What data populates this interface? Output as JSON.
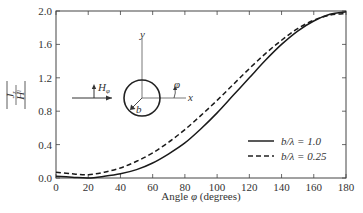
{
  "chart_data": {
    "type": "line",
    "title": "",
    "xlabel": "Angle φ (degrees)",
    "ylabel": "|J_z / H^i|",
    "xlim": [
      0,
      180
    ],
    "ylim": [
      0.0,
      2.0
    ],
    "x_ticks": [
      "0",
      "20",
      "40",
      "60",
      "80",
      "100",
      "120",
      "140",
      "160",
      "180"
    ],
    "y_ticks": [
      "0.0",
      "0.4",
      "0.8",
      "1.2",
      "1.6",
      "2.0"
    ],
    "grid": false,
    "legend_position": "lower right",
    "x": [
      0,
      10,
      20,
      30,
      40,
      50,
      60,
      70,
      80,
      90,
      100,
      110,
      120,
      130,
      140,
      150,
      160,
      170,
      180
    ],
    "series": [
      {
        "name": "b/λ = 1.0",
        "style": "solid",
        "values": [
          0.02,
          0.01,
          0.0,
          0.02,
          0.05,
          0.1,
          0.18,
          0.29,
          0.42,
          0.59,
          0.78,
          0.99,
          1.2,
          1.41,
          1.6,
          1.76,
          1.88,
          1.96,
          1.99
        ]
      },
      {
        "name": "b/λ = 0.25",
        "style": "dashed",
        "values": [
          0.07,
          0.05,
          0.04,
          0.07,
          0.12,
          0.2,
          0.3,
          0.43,
          0.58,
          0.75,
          0.93,
          1.12,
          1.31,
          1.49,
          1.65,
          1.79,
          1.89,
          1.95,
          1.97
        ]
      }
    ]
  },
  "axes": {
    "xlabel_prefix": "Angle ",
    "xlabel_symbol": "φ",
    "xlabel_suffix": " (degrees)",
    "ylabel_num": "J",
    "ylabel_num_sub": "z",
    "ylabel_den": "H",
    "ylabel_den_sup": "i"
  },
  "inset": {
    "h_label": "H",
    "h_sub": "φ",
    "y_axis_label": "y",
    "x_axis_label": "x",
    "phi_label": "φ",
    "radius_label": "b"
  },
  "legend": [
    {
      "label": "b/λ = 1.0",
      "style": "solid"
    },
    {
      "label": "b/λ = 0.25",
      "style": "dashed"
    }
  ]
}
